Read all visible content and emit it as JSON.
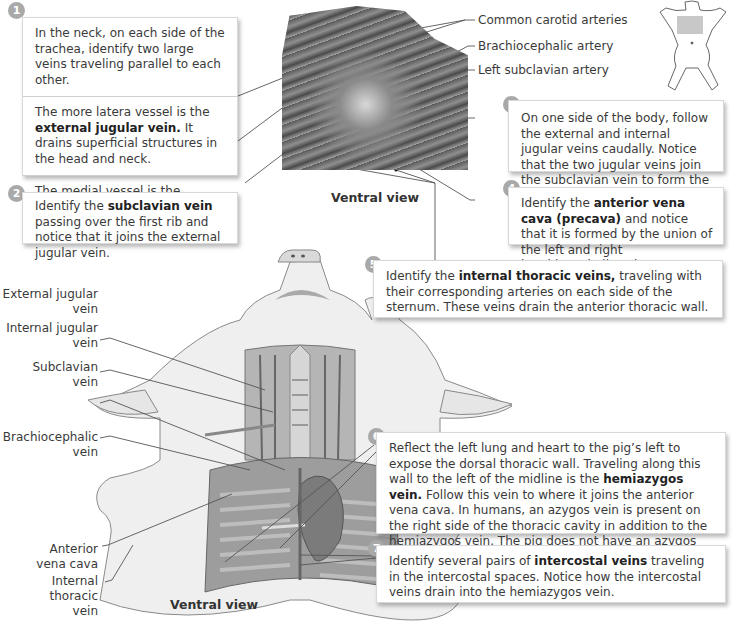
{
  "top_section": {
    "photo": {
      "name": "dissection-photo-neck-thorax",
      "caption": "Ventral view"
    },
    "artery_labels": [
      {
        "text": "Common carotid arteries"
      },
      {
        "text": "Brachiocephalic artery"
      },
      {
        "text": "Left subclavian artery"
      }
    ],
    "orientation_icon": "pig-outline-with-shaded-thorax"
  },
  "steps": [
    {
      "number": "1",
      "segments": [
        {
          "parts": [
            {
              "text": "In the neck, on each side of the trachea, identify two large veins traveling parallel to each other.",
              "bold": false
            }
          ]
        },
        {
          "parts": [
            {
              "text": "The more latera  vessel is the ",
              "bold": false
            },
            {
              "text": "external jugular vein.",
              "bold": true
            },
            {
              "text": " It drains superficial structures in the head and neck.",
              "bold": false
            }
          ]
        },
        {
          "parts": [
            {
              "text": "The medial vessel is the ",
              "bold": false
            },
            {
              "text": "internal jugular vein,",
              "bold": true
            },
            {
              "text": " w ich drains the brain.",
              "bold": false
            }
          ]
        }
      ]
    },
    {
      "number": "2",
      "segments": [
        {
          "parts": [
            {
              "text": "Identify the ",
              "bold": false
            },
            {
              "text": "subclavian vein",
              "bold": true
            },
            {
              "text": " passing over the first rib and notice that it joins the external jugular vein.",
              "bold": false
            }
          ]
        }
      ]
    },
    {
      "number": "3",
      "segments": [
        {
          "parts": [
            {
              "text": "On one side of the body, follow the external and internal jugular veins caudally. Notice that the two jugular veins join the subclavian vein to form the ",
              "bold": false
            },
            {
              "text": "brachiocephalic vein.",
              "bold": true
            }
          ]
        }
      ]
    },
    {
      "number": "4",
      "segments": [
        {
          "parts": [
            {
              "text": "Identify the ",
              "bold": false
            },
            {
              "text": "anterior vena cava (precava)",
              "bold": true
            },
            {
              "text": " and notice that it is formed by the union of the left and right brachiocephalic veins.",
              "bold": false
            }
          ]
        }
      ]
    },
    {
      "number": "5",
      "segments": [
        {
          "parts": [
            {
              "text": "Identify the ",
              "bold": false
            },
            {
              "text": "internal thoracic veins,",
              "bold": true
            },
            {
              "text": " traveling with their corresponding arteries on each side of the sternum. These veins drain the anterior thoracic wall.",
              "bold": false
            }
          ]
        }
      ]
    },
    {
      "number": "6",
      "segments": [
        {
          "parts": [
            {
              "text": "Reflect the left lung and heart to the pig’s left to expose the dorsal thoracic wall. Traveling along this wall to the left of the midline is the ",
              "bold": false
            },
            {
              "text": "hemiazygos vein.",
              "bold": true
            },
            {
              "text": " Follow this vein to where it joins the anterior vena cava. In humans, an azygos vein is present on the right side of the thoracic cavity in addition to the hemiazygos vein. The pig does not have an azygos vein.",
              "bold": false
            }
          ]
        }
      ]
    },
    {
      "number": "7",
      "segments": [
        {
          "parts": [
            {
              "text": "Identify several pairs of ",
              "bold": false
            },
            {
              "text": "intercostal veins",
              "bold": true
            },
            {
              "text": " traveling in the intercostal spaces. Notice how the intercostal veins drain into the hemiazygos vein.",
              "bold": false
            }
          ]
        }
      ]
    }
  ],
  "bottom_section": {
    "illustration": {
      "name": "pig-ventral-dissection-illustration",
      "caption": "Ventral view"
    },
    "vein_labels": [
      {
        "line1": "External jugular",
        "line2": "vein"
      },
      {
        "line1": "Internal jugular",
        "line2": "vein"
      },
      {
        "line1": "Subclavian",
        "line2": "vein"
      },
      {
        "line1": "Brachiocephalic",
        "line2": "vein"
      },
      {
        "line1": "Anterior",
        "line2": "vena cava"
      },
      {
        "line1": "Internal thoracic",
        "line2": "vein"
      }
    ]
  },
  "colors": {
    "badge": "#a9a9a9",
    "box_border": "#d8d8d8",
    "leader_line": "#555555",
    "text": "#3a3a3a"
  }
}
